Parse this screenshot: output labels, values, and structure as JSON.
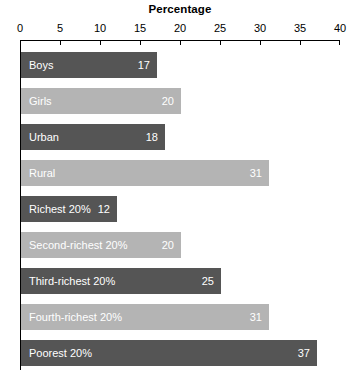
{
  "chart_data": {
    "type": "bar",
    "orientation": "horizontal",
    "title": "Percentage",
    "xlabel": "",
    "ylabel": "",
    "xlim": [
      0,
      40
    ],
    "xticks": [
      0,
      5,
      10,
      15,
      20,
      25,
      30,
      35,
      40
    ],
    "xtick_labels": [
      "0",
      "5",
      "10",
      "15",
      "20",
      "25",
      "30",
      "35",
      "40"
    ],
    "grid": false,
    "legend": "none",
    "categories": [
      "Boys",
      "Girls",
      "Urban",
      "Rural",
      "Richest 20%",
      "Second-richest 20%",
      "Third-richest 20%",
      "Fourth-richest 20%",
      "Poorest 20%"
    ],
    "values": [
      17,
      20,
      18,
      31,
      12,
      20,
      25,
      31,
      37
    ],
    "bars": [
      {
        "label": "Boys",
        "value": 17,
        "value_text": "17",
        "shade": "dark"
      },
      {
        "label": "Girls",
        "value": 20,
        "value_text": "20",
        "shade": "light"
      },
      {
        "label": "Urban",
        "value": 18,
        "value_text": "18",
        "shade": "dark"
      },
      {
        "label": "Rural",
        "value": 31,
        "value_text": "31",
        "shade": "light"
      },
      {
        "label": "Richest 20%",
        "value": 12,
        "value_text": "12",
        "shade": "dark"
      },
      {
        "label": "Second-richest 20%",
        "value": 20,
        "value_text": "20",
        "shade": "light"
      },
      {
        "label": "Third-richest 20%",
        "value": 25,
        "value_text": "25",
        "shade": "dark"
      },
      {
        "label": "Fourth-richest 20%",
        "value": 31,
        "value_text": "31",
        "shade": "light"
      },
      {
        "label": "Poorest 20%",
        "value": 37,
        "value_text": "37",
        "shade": "dark"
      }
    ]
  },
  "colors": {
    "bar_dark": "#555555",
    "bar_light": "#b4b4b4",
    "axis": "#000000",
    "label_text": "#ffffff",
    "background": "#ffffff"
  }
}
